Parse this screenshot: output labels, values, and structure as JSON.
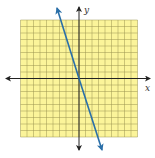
{
  "graph": {
    "type": "coordinate-plane",
    "grid": {
      "cols": 18,
      "rows": 18,
      "x_range": [
        -9,
        9
      ],
      "y_range": [
        -9,
        9
      ],
      "cell_px": 6.5,
      "origin_px": [
        79,
        78.5
      ],
      "left_px": 20.5,
      "top_px": 20
    },
    "axes": {
      "x_label": "x",
      "y_label": "y"
    },
    "line": {
      "equation": "y = -3x",
      "slope": -3,
      "intercept": 0,
      "arrows": "both"
    },
    "colors": {
      "grid_fill": "#fbf49a",
      "grid_line": "#9a9450",
      "axis": "#222222",
      "line": "#2a6fa8"
    }
  }
}
